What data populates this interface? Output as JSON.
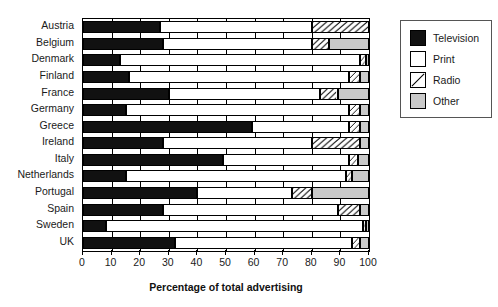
{
  "chart_data": {
    "type": "bar",
    "orientation": "horizontal",
    "stacked": true,
    "title": "",
    "xlabel": "Percentage of total advertising",
    "ylabel": "",
    "xlim": [
      0,
      100
    ],
    "xticks": [
      0,
      10,
      20,
      30,
      40,
      50,
      60,
      70,
      80,
      90,
      100
    ],
    "grid": true,
    "legend_position": "right",
    "categories": [
      "Austria",
      "Belgium",
      "Denmark",
      "Finland",
      "France",
      "Germany",
      "Greece",
      "Ireland",
      "Italy",
      "Netherlands",
      "Portugal",
      "Spain",
      "Sweden",
      "UK"
    ],
    "series": [
      {
        "name": "Television",
        "color": "#111111",
        "values": [
          27,
          28,
          13,
          16,
          30,
          15,
          59,
          28,
          49,
          15,
          40,
          28,
          8,
          32
        ]
      },
      {
        "name": "Print",
        "color": "#ffffff",
        "values": [
          53,
          52,
          84,
          77,
          53,
          78,
          34,
          52,
          44,
          77,
          33,
          61,
          90,
          62
        ]
      },
      {
        "name": "Radio",
        "color": "#ffffff",
        "pattern": "diagonal-hatch",
        "values": [
          20,
          6,
          2,
          4,
          6,
          4,
          4,
          17,
          3,
          2,
          7,
          8,
          1,
          3
        ]
      },
      {
        "name": "Other",
        "color": "#c9c9c9",
        "values": [
          0,
          14,
          1,
          3,
          11,
          3,
          3,
          3,
          4,
          6,
          20,
          3,
          1,
          3
        ]
      }
    ]
  },
  "legend": {
    "items": [
      {
        "label": "Television",
        "swatch": "solid-black-swatch"
      },
      {
        "label": "Print",
        "swatch": "white-swatch"
      },
      {
        "label": "Radio",
        "swatch": "hatched-swatch"
      },
      {
        "label": "Other",
        "swatch": "gray-swatch"
      }
    ]
  }
}
